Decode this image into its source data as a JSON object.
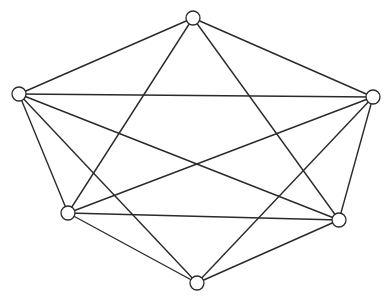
{
  "diagram": {
    "type": "graph",
    "node_radius": 7,
    "colors": {
      "stroke": "#2a2a2a",
      "node_fill": "#ffffff",
      "background": "#ffffff"
    },
    "nodes": [
      {
        "id": "A",
        "x": 193,
        "y": 18
      },
      {
        "id": "B",
        "x": 19,
        "y": 94
      },
      {
        "id": "C",
        "x": 373,
        "y": 97
      },
      {
        "id": "D",
        "x": 68,
        "y": 213
      },
      {
        "id": "E",
        "x": 339,
        "y": 220
      },
      {
        "id": "F",
        "x": 197,
        "y": 283
      }
    ],
    "edges": [
      [
        "A",
        "B"
      ],
      [
        "A",
        "C"
      ],
      [
        "A",
        "D"
      ],
      [
        "A",
        "E"
      ],
      [
        "B",
        "C"
      ],
      [
        "B",
        "D"
      ],
      [
        "B",
        "E"
      ],
      [
        "B",
        "F"
      ],
      [
        "C",
        "D"
      ],
      [
        "C",
        "E"
      ],
      [
        "C",
        "F"
      ],
      [
        "D",
        "E"
      ],
      [
        "D",
        "F"
      ],
      [
        "E",
        "F"
      ]
    ]
  }
}
